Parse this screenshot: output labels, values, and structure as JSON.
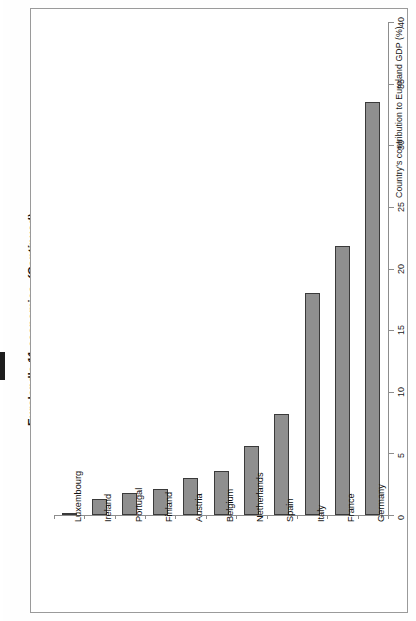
{
  "caption": {
    "text": "Euroland's 11 economies.",
    "continued": "(Continued)"
  },
  "chart_data": {
    "type": "bar",
    "orientation": "rotated-90",
    "title": "Euroland's 11 economies. (Continued)",
    "categories": [
      "Luxembourg",
      "Ireland",
      "Portugal",
      "Finland",
      "Austria",
      "Belgium",
      "Netherlands",
      "Spain",
      "Italy",
      "France",
      "Germany"
    ],
    "values": [
      0.2,
      1.3,
      1.8,
      2.1,
      3.0,
      3.6,
      5.6,
      8.2,
      18.0,
      21.8,
      33.5
    ],
    "xlabel": "",
    "ylabel": "Country's contribution to Euroland GDP (%)",
    "ylim": [
      0,
      40
    ],
    "yticks": [
      0,
      5,
      10,
      15,
      20,
      25,
      30,
      35,
      40
    ],
    "ytick_labels": [
      "0",
      "5",
      "10",
      "15",
      "20",
      "25",
      "30",
      "35",
      "40"
    ],
    "grid": false,
    "legend": "none",
    "bar_fill": "#8f8f8f",
    "bar_edge": "#3a3a3a",
    "axis_color": "#8d8d8d"
  }
}
